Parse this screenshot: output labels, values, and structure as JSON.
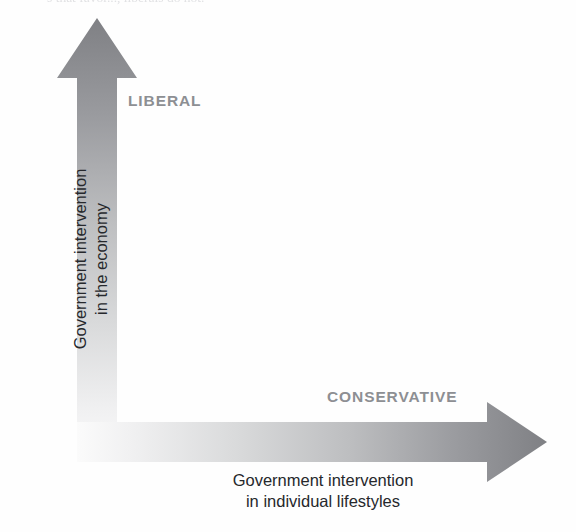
{
  "page": {
    "width": 576,
    "height": 532,
    "background_color": "#ffffff",
    "clipped_header_text": "s that favor..., liberals do not."
  },
  "diagram": {
    "quadrant_labels": {
      "liberal": "LIBERAL",
      "conservative": "CONSERVATIVE"
    },
    "axes": {
      "y": {
        "line1": "Government intervention",
        "line2": "in the economy",
        "direction": "up",
        "arrow_color_start": "#808185",
        "arrow_color_end": "#f2f2f2"
      },
      "x": {
        "line1": "Government intervention",
        "line2": "in individual lifestyles",
        "direction": "right",
        "arrow_color_start": "#f2f2f2",
        "arrow_color_end": "#808185"
      }
    },
    "colors": {
      "arrow_dark": "#808185",
      "arrow_light": "#f4f4f4",
      "label_gray": "#8d8f93",
      "caption_black": "#26282c"
    }
  }
}
